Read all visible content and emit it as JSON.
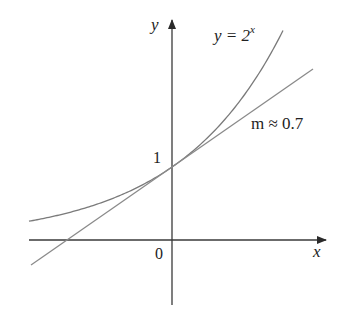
{
  "figure": {
    "type": "function-graph",
    "axes": {
      "x_label": "x",
      "y_label": "y",
      "origin_label": "0",
      "y_intercept_label": "1"
    },
    "curves": [
      {
        "name": "exponential",
        "label_lhs": "y = 2",
        "label_exp": "x",
        "function": "2^x",
        "color": "#7a7a7a"
      },
      {
        "name": "tangent-line",
        "label": "m ≈ 0.7",
        "slope": 0.7,
        "through": [
          0,
          1
        ],
        "color": "#8a8a8a"
      }
    ],
    "colors": {
      "axis": "#3a3a3a",
      "curve": "#7a7a7a",
      "text": "#222222"
    }
  },
  "chart_data": {
    "type": "line",
    "title": "",
    "xlabel": "x",
    "ylabel": "y",
    "xlim": [
      -1.96,
      2.1
    ],
    "ylim": [
      -0.9,
      3.0
    ],
    "grid": false,
    "series": [
      {
        "name": "y = 2^x",
        "x": [
          -1.96,
          -1,
          0,
          0.5,
          1,
          1.52
        ],
        "y": [
          0.26,
          0.5,
          1,
          1.41,
          2,
          2.87
        ]
      },
      {
        "name": "tangent m ≈ 0.7",
        "x": [
          -1.93,
          -1.43,
          0,
          1,
          1.93
        ],
        "y": [
          -0.34,
          0,
          1,
          1.7,
          2.34
        ]
      }
    ],
    "annotations": [
      "y = 2^x",
      "m ≈ 0.7",
      "1",
      "0"
    ]
  }
}
